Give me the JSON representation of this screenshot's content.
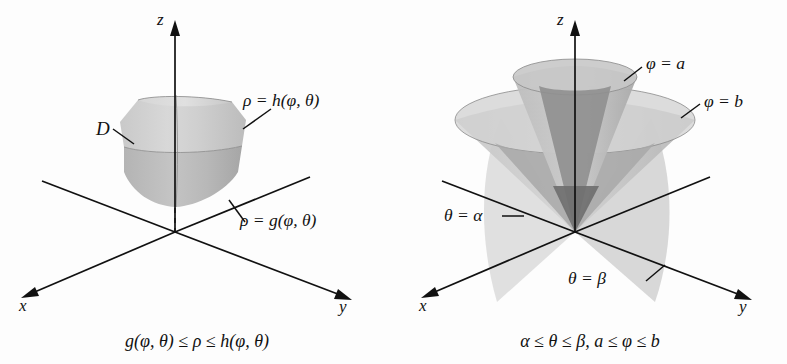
{
  "figure": {
    "background_color": "#fdfdfd",
    "ink_color": "#111111",
    "fill_light": "#d0d0d0",
    "fill_mid": "#bdbdbd",
    "fill_dark": "#9a9a9a",
    "fill_darkest": "#7e7e7e"
  },
  "panels": [
    {
      "id": "left",
      "caption": "g(φ, θ) ≤ ρ ≤ h(φ, θ)",
      "axes": [
        {
          "name": "z",
          "label": "z"
        },
        {
          "name": "x",
          "label": "x"
        },
        {
          "name": "y",
          "label": "y"
        }
      ],
      "labels": [
        {
          "name": "region-label",
          "text": "D"
        },
        {
          "name": "outer-surface-label",
          "text": "ρ = h(φ, θ)"
        },
        {
          "name": "inner-surface-label",
          "text": "ρ = g(φ, θ)"
        }
      ]
    },
    {
      "id": "right",
      "caption": "α ≤ θ ≤ β, a ≤ φ ≤ b",
      "axes": [
        {
          "name": "z",
          "label": "z"
        },
        {
          "name": "x",
          "label": "x"
        },
        {
          "name": "y",
          "label": "y"
        }
      ],
      "labels": [
        {
          "name": "inner-cone-label",
          "text": "φ = a"
        },
        {
          "name": "outer-cone-label",
          "text": "φ = b"
        },
        {
          "name": "theta-alpha-label",
          "text": "θ = α"
        },
        {
          "name": "theta-beta-label",
          "text": "θ = β"
        }
      ]
    }
  ]
}
